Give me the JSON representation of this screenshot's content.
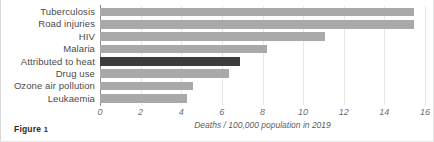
{
  "figure": {
    "caption_label": "Figure",
    "caption_number": "1"
  },
  "chart_data": {
    "type": "bar",
    "orientation": "horizontal",
    "title": "",
    "xlabel": "Deaths / 100,000 population in 2019",
    "ylabel": "",
    "xlim": [
      0,
      16
    ],
    "xticks": [
      0,
      2,
      4,
      6,
      8,
      10,
      12,
      14,
      16
    ],
    "xtick_labels": [
      "0",
      "2",
      "4",
      "6",
      "8",
      "10",
      "12",
      "14",
      "16"
    ],
    "grid": true,
    "grid_axis": "x",
    "legend": false,
    "categories": [
      "Tuberculosis",
      "Road injuries",
      "HIV",
      "Malaria",
      "Attributed to heat",
      "Drug use",
      "Ozone air pollution",
      "Leukaemia"
    ],
    "values": [
      15.45,
      15.45,
      11.1,
      8.2,
      6.9,
      6.35,
      4.6,
      4.3
    ],
    "highlight_category": "Attributed to heat",
    "colors": {
      "bar": "#a9a9a9",
      "bar_highlight": "#3c3c3c",
      "gridline": "#e6e6e6",
      "axis": "#8d8d8d",
      "label_text": "#4a4a4a",
      "tick_text": "#6d6d6d"
    }
  }
}
